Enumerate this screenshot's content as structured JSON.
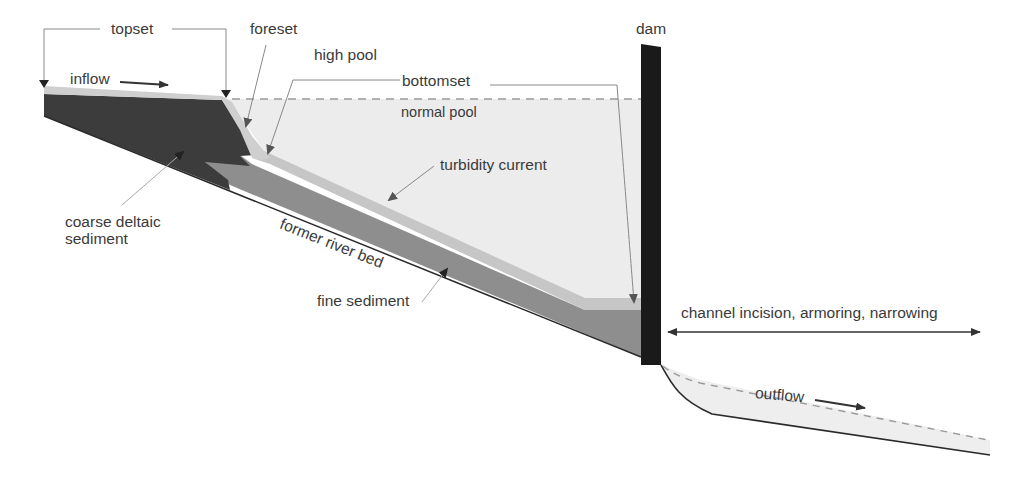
{
  "diagram": {
    "labels": {
      "topset": "topset",
      "foreset": "foreset",
      "high_pool": "high pool",
      "bottomset": "bottomset",
      "normal_pool": "normal pool",
      "dam": "dam",
      "inflow": "inflow",
      "turbidity_current": "turbidity current",
      "coarse_deltaic_sediment": "coarse deltaic\nsediment",
      "former_river_bed": "former river bed",
      "fine_sediment": "fine sediment",
      "channel_change": "channel incision, armoring, narrowing",
      "outflow": "outflow"
    },
    "colors": {
      "coarse_sediment": "#3c3c3c",
      "fine_sediment": "#8e8e8e",
      "turbidity_layer": "#c8c8c8",
      "topset_layer": "#cfcfcf",
      "pool_water": "#ececec",
      "dam": "#1a1a1a",
      "outflow_water": "#eeeeee",
      "riverbed_line": "#2a2a2a",
      "leader_line": "#888888",
      "arrow": "#333333",
      "text": "#3a3a3a"
    }
  }
}
